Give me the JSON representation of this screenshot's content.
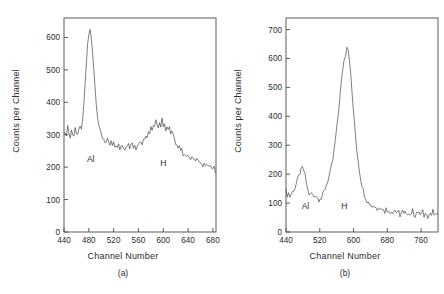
{
  "figure": {
    "background": "#ffffff",
    "trace_color": "#3a3a3a",
    "axis_color": "#4a4a4a"
  },
  "panel_a": {
    "caption": "(a)",
    "xlabel": "Channel Number",
    "ylabel": "Counts per Channel",
    "xticks": [
      "440",
      "480",
      "520",
      "560",
      "600",
      "640",
      "680"
    ],
    "yticks": [
      "0",
      "100",
      "200",
      "300",
      "400",
      "500",
      "600"
    ],
    "annotations": [
      {
        "label": "Al",
        "x": 483,
        "y": 215
      },
      {
        "label": "H",
        "x": 600,
        "y": 205
      }
    ]
  },
  "panel_b": {
    "caption": "(b)",
    "xlabel": "Channel Number",
    "ylabel": "Counts per Channel",
    "xticks": [
      "440",
      "520",
      "600",
      "680",
      "760"
    ],
    "yticks": [
      "0",
      "100",
      "200",
      "300",
      "400",
      "500",
      "600",
      "700"
    ],
    "annotations": [
      {
        "label": "Al",
        "x": 486,
        "y": 78
      },
      {
        "label": "H",
        "x": 578,
        "y": 78
      }
    ]
  },
  "chart_data": [
    {
      "type": "line",
      "id": "panel-a",
      "title": "(a)",
      "xlabel": "Channel Number",
      "ylabel": "Counts per Channel",
      "xlim": [
        440,
        685
      ],
      "ylim": [
        0,
        660
      ],
      "xticks": [
        440,
        480,
        520,
        560,
        600,
        640,
        680
      ],
      "yticks": [
        0,
        100,
        200,
        300,
        400,
        500,
        600
      ],
      "grid": false,
      "legend": null,
      "annotations": [
        {
          "text": "Al",
          "x": 483,
          "y": 215,
          "note": "aluminium surface peak label"
        },
        {
          "text": "H",
          "x": 600,
          "y": 205,
          "note": "hydrogen peak label"
        }
      ],
      "series": [
        {
          "name": "Counts per Channel",
          "x": [
            440,
            442,
            444,
            446,
            448,
            450,
            452,
            454,
            456,
            458,
            460,
            462,
            464,
            466,
            468,
            470,
            472,
            474,
            476,
            478,
            480,
            482,
            484,
            486,
            488,
            490,
            492,
            494,
            496,
            498,
            500,
            502,
            504,
            506,
            508,
            510,
            512,
            514,
            516,
            518,
            520,
            522,
            524,
            526,
            528,
            530,
            532,
            534,
            536,
            538,
            540,
            542,
            544,
            546,
            548,
            550,
            552,
            554,
            556,
            558,
            560,
            562,
            564,
            566,
            568,
            570,
            572,
            574,
            576,
            578,
            580,
            582,
            584,
            586,
            588,
            590,
            592,
            594,
            596,
            598,
            600,
            602,
            604,
            606,
            608,
            610,
            612,
            614,
            616,
            618,
            620,
            622,
            624,
            626,
            628,
            630,
            632,
            634,
            636,
            638,
            640,
            642,
            644,
            646,
            648,
            650,
            652,
            654,
            656,
            658,
            660,
            662,
            664,
            666,
            668,
            670,
            672,
            674,
            676,
            678,
            680,
            682,
            684
          ],
          "y": [
            300,
            312,
            296,
            330,
            305,
            288,
            320,
            302,
            295,
            315,
            298,
            306,
            310,
            322,
            318,
            340,
            395,
            455,
            520,
            575,
            608,
            622,
            600,
            560,
            505,
            448,
            400,
            358,
            330,
            312,
            300,
            292,
            288,
            280,
            275,
            282,
            272,
            268,
            278,
            265,
            272,
            262,
            270,
            258,
            268,
            256,
            265,
            272,
            262,
            255,
            268,
            260,
            272,
            258,
            266,
            275,
            262,
            270,
            258,
            268,
            278,
            272,
            285,
            275,
            292,
            285,
            300,
            292,
            312,
            305,
            325,
            318,
            335,
            330,
            345,
            338,
            318,
            342,
            330,
            348,
            325,
            340,
            315,
            330,
            318,
            325,
            305,
            312,
            295,
            285,
            275,
            268,
            255,
            262,
            248,
            252,
            240,
            245,
            235,
            238,
            230,
            236,
            228,
            232,
            222,
            228,
            218,
            224,
            215,
            220,
            212,
            216,
            208,
            212,
            205,
            208,
            200,
            204,
            198,
            200,
            192,
            196,
            188
          ]
        }
      ]
    },
    {
      "type": "line",
      "id": "panel-b",
      "title": "(b)",
      "xlabel": "Channel Number",
      "ylabel": "Counts per Channel",
      "xlim": [
        440,
        800
      ],
      "ylim": [
        0,
        740
      ],
      "xticks": [
        440,
        520,
        600,
        680,
        760
      ],
      "yticks": [
        0,
        100,
        200,
        300,
        400,
        500,
        600,
        700
      ],
      "grid": false,
      "legend": null,
      "annotations": [
        {
          "text": "Al",
          "x": 486,
          "y": 78,
          "note": "aluminium surface peak label"
        },
        {
          "text": "H",
          "x": 578,
          "y": 78,
          "note": "hydrogen peak label"
        }
      ],
      "series": [
        {
          "name": "Counts per Channel",
          "x": [
            440,
            443,
            446,
            449,
            452,
            455,
            458,
            461,
            464,
            467,
            470,
            473,
            476,
            479,
            482,
            485,
            488,
            491,
            494,
            497,
            500,
            503,
            506,
            509,
            512,
            515,
            518,
            521,
            524,
            527,
            530,
            533,
            536,
            539,
            542,
            545,
            548,
            551,
            554,
            557,
            560,
            563,
            566,
            569,
            572,
            575,
            578,
            581,
            584,
            587,
            590,
            593,
            596,
            599,
            602,
            605,
            608,
            611,
            614,
            617,
            620,
            623,
            626,
            629,
            632,
            635,
            638,
            641,
            644,
            647,
            650,
            653,
            656,
            659,
            662,
            665,
            668,
            671,
            674,
            677,
            680,
            683,
            686,
            689,
            692,
            695,
            698,
            701,
            704,
            707,
            710,
            713,
            716,
            719,
            722,
            725,
            728,
            731,
            734,
            737,
            740,
            743,
            746,
            749,
            752,
            755,
            758,
            761,
            764,
            767,
            770,
            773,
            776,
            779,
            782,
            785,
            788,
            791,
            794,
            797,
            800
          ],
          "y": [
            142,
            128,
            135,
            122,
            130,
            138,
            145,
            152,
            165,
            178,
            192,
            205,
            215,
            222,
            212,
            196,
            172,
            150,
            132,
            126,
            135,
            128,
            122,
            130,
            124,
            118,
            112,
            120,
            115,
            128,
            140,
            152,
            165,
            178,
            192,
            208,
            228,
            252,
            282,
            318,
            355,
            398,
            442,
            488,
            528,
            572,
            598,
            612,
            645,
            635,
            600,
            548,
            490,
            432,
            378,
            325,
            282,
            245,
            212,
            185,
            162,
            145,
            128,
            118,
            108,
            102,
            98,
            95,
            88,
            92,
            85,
            90,
            82,
            88,
            78,
            85,
            75,
            82,
            72,
            80,
            70,
            78,
            68,
            75,
            65,
            72,
            78,
            68,
            62,
            70,
            58,
            66,
            72,
            60,
            68,
            56,
            64,
            70,
            58,
            66,
            74,
            62,
            56,
            68,
            60,
            72,
            58,
            64,
            70,
            56,
            62,
            68,
            54,
            60,
            66,
            58,
            72,
            60,
            54,
            66,
            58
          ]
        }
      ]
    }
  ]
}
